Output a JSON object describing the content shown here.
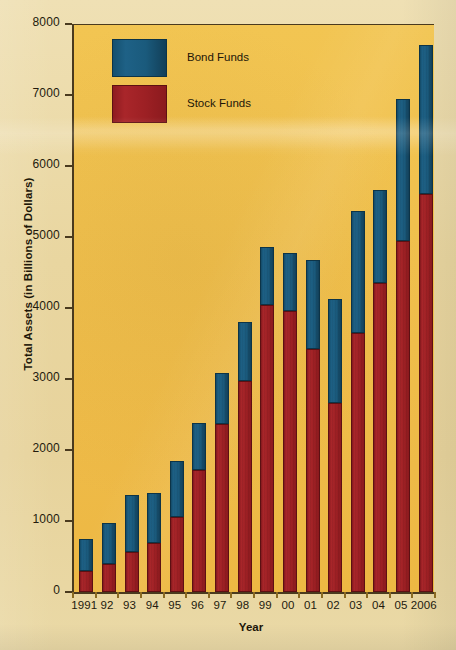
{
  "chart_data": {
    "type": "bar",
    "subtype": "stacked-vertical",
    "title": "",
    "xlabel": "Year",
    "ylabel": "Total Assets (in Billions of Dollars)",
    "categories": [
      "1991",
      "92",
      "93",
      "94",
      "95",
      "96",
      "97",
      "98",
      "99",
      "00",
      "01",
      "02",
      "03",
      "04",
      "05",
      "2006"
    ],
    "series": [
      {
        "name": "Stock Funds",
        "color": "#9d2024",
        "values": [
          290,
          400,
          570,
          690,
          1050,
          1720,
          2360,
          2970,
          4040,
          3960,
          3420,
          2660,
          3650,
          4350,
          4940,
          5600
        ]
      },
      {
        "name": "Bond Funds",
        "color": "#1a5a7c",
        "values": [
          450,
          570,
          800,
          700,
          790,
          660,
          730,
          840,
          820,
          820,
          1260,
          1460,
          1710,
          1310,
          2010,
          2100
        ]
      }
    ],
    "totals": [
      740,
      970,
      1370,
      1390,
      1840,
      2380,
      3090,
      3810,
      4860,
      4780,
      4680,
      4120,
      5360,
      5660,
      6950,
      7700
    ],
    "ylim": [
      0,
      8000
    ],
    "yticks": [
      0,
      1000,
      2000,
      3000,
      4000,
      5000,
      6000,
      7000,
      8000
    ],
    "ytick_labels": [
      "0",
      "1000",
      "2000",
      "3000",
      "4000",
      "5000",
      "6000",
      "7000",
      "8000"
    ],
    "grid": false,
    "legend_position": "top-left",
    "legend_order": [
      "Bond Funds",
      "Stock Funds"
    ],
    "stack_order_bottom_to_top": [
      "Stock Funds",
      "Bond Funds"
    ]
  },
  "legend": {
    "items": [
      {
        "label": "Bond Funds",
        "swatch": "bond"
      },
      {
        "label": "Stock Funds",
        "swatch": "stock"
      }
    ]
  },
  "axes": {
    "x_title": "Year",
    "y_title": "Total Assets (in Billions of Dollars)"
  },
  "colors": {
    "stock": "#9d2024",
    "bond": "#1a5a7c",
    "plot_background": "#f0c04d",
    "page_background": "#e9d6a0",
    "axis": "#4a3a1e",
    "text": "#231a0d"
  }
}
